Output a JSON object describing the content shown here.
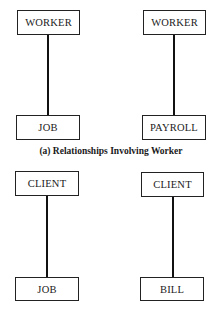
{
  "diagram": {
    "section_a": {
      "caption": "(a) Relationships Involving Worker",
      "pairs": [
        {
          "top": "WORKER",
          "bottom": "JOB"
        },
        {
          "top": "WORKER",
          "bottom": "PAYROLL"
        }
      ]
    },
    "section_b": {
      "caption": "",
      "pairs": [
        {
          "top": "CLIENT",
          "bottom": "JOB"
        },
        {
          "top": "CLIENT",
          "bottom": "BILL"
        }
      ]
    }
  }
}
